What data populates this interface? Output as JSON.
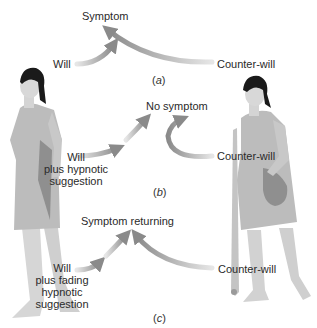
{
  "panels": {
    "a": {
      "caption_open": "(",
      "caption_letter": "a",
      "caption_close": ")",
      "outcome": "Symptom",
      "left_label": "Will",
      "right_label": "Counter-will"
    },
    "b": {
      "caption_open": "(",
      "caption_letter": "b",
      "caption_close": ")",
      "outcome": "No symptom",
      "left_label_lines": [
        "Will",
        "plus hypnotic",
        "suggestion"
      ],
      "right_label": "Counter-will"
    },
    "c": {
      "caption_open": "(",
      "caption_letter": "c",
      "caption_close": ")",
      "outcome": "Symptom returning",
      "left_label_lines": [
        "Will",
        "plus fading",
        "hypnotic",
        "suggestion"
      ],
      "right_label": "Counter-will"
    }
  },
  "figures": {
    "left": "woman-walking-upright",
    "right": "woman-with-crutch"
  },
  "colors": {
    "gown": "#b9b9b9",
    "gown_shadow": "#8f8f8f",
    "skin": "#d4d4d4",
    "hair": "#1a1a1a",
    "arrow_dark": "#8a8a8a",
    "arrow_light": "#e6e6e6"
  }
}
